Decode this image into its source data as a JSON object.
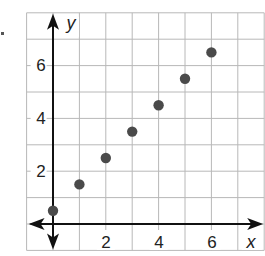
{
  "chart_data": {
    "type": "scatter",
    "title": "",
    "xlabel": "x",
    "ylabel": "y",
    "x": [
      0,
      1,
      2,
      3,
      4,
      5,
      6
    ],
    "y": [
      0.5,
      1.5,
      2.5,
      3.5,
      4.5,
      5.5,
      6.5
    ],
    "points": [
      [
        0,
        0.5
      ],
      [
        1,
        1.5
      ],
      [
        2,
        2.5
      ],
      [
        3,
        3.5
      ],
      [
        4,
        4.5
      ],
      [
        5,
        5.5
      ],
      [
        6,
        6.5
      ]
    ],
    "xlim": [
      -1,
      8
    ],
    "ylim": [
      -1,
      8
    ],
    "x_ticks": [
      2,
      4,
      6
    ],
    "y_ticks": [
      2,
      4,
      6
    ],
    "grid": true,
    "grid_step": 1,
    "marker_color": "#4a4a4a",
    "grid_color": "#b8b8b8",
    "axis_color": "#111111"
  },
  "labels": {
    "x_axis": "x",
    "y_axis": "y",
    "x_ticks": [
      "2",
      "4",
      "6"
    ],
    "y_ticks": [
      "2",
      "4",
      "6"
    ]
  }
}
